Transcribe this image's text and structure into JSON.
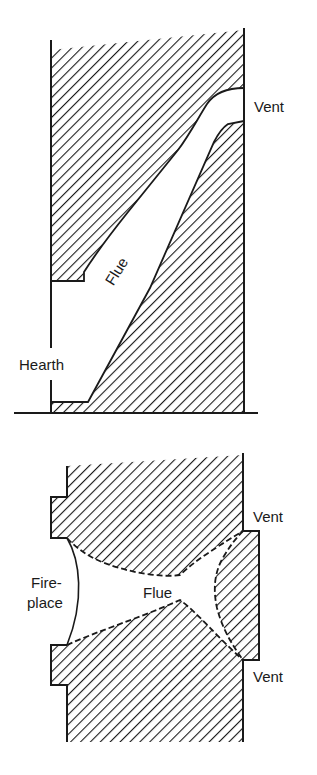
{
  "colors": {
    "ink": "#1a1a1a",
    "background": "#ffffff"
  },
  "top_diagram": {
    "view": "section",
    "labels": {
      "vent": "Vent",
      "flue": "Flue",
      "hearth": "Hearth"
    }
  },
  "bottom_diagram": {
    "view": "plan",
    "labels": {
      "vent_upper": "Vent",
      "vent_lower": "Vent",
      "flue": "Flue",
      "fireplace_line1": "Fire-",
      "fireplace_line2": "place"
    }
  }
}
